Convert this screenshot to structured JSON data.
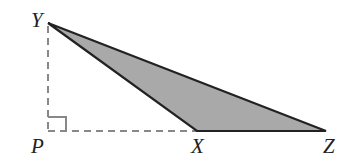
{
  "diagram": {
    "type": "geometry",
    "points": {
      "Y": {
        "label": "Y",
        "x": 48,
        "y": 23
      },
      "P": {
        "label": "P",
        "x": 48,
        "y": 131
      },
      "X": {
        "label": "X",
        "x": 197,
        "y": 131
      },
      "Z": {
        "label": "Z",
        "x": 326,
        "y": 131
      }
    },
    "triangle": [
      "X",
      "Y",
      "Z"
    ],
    "dashed_segments": [
      [
        "Y",
        "P"
      ],
      [
        "P",
        "X"
      ]
    ],
    "right_angle_at": "P",
    "colors": {
      "fill": "#a9a9a9",
      "stroke": "#222222",
      "dashed": "#888888"
    }
  }
}
